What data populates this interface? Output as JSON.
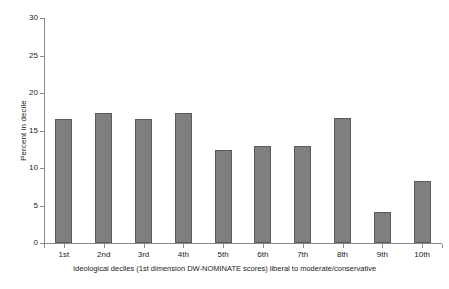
{
  "chart_data": {
    "type": "bar",
    "title": "",
    "subtitle": "",
    "xlabel": "Ideological deciles (1st dimension DW-NOMINATE scores) liberal to moderate/conservative",
    "ylabel": "Percent in decile",
    "categories": [
      "1st",
      "2nd",
      "3rd",
      "4th",
      "5th",
      "6th",
      "7th",
      "8th",
      "9th",
      "10th"
    ],
    "values": [
      16.6,
      17.3,
      16.6,
      17.3,
      12.4,
      13.0,
      13.0,
      16.7,
      4.2,
      8.3
    ],
    "ylim": [
      0,
      30
    ],
    "ytick_values": [
      0,
      5,
      10,
      15,
      20,
      25,
      30
    ],
    "ytick_labels": [
      "0",
      "5",
      "10",
      "15",
      "20",
      "25",
      "30"
    ],
    "grid": false,
    "legend": null,
    "bar_color": "#7f7f7f",
    "bar_border_color": "#5a5a5a",
    "axis_color": "#8a8a8a",
    "background_color": "#ffffff"
  }
}
